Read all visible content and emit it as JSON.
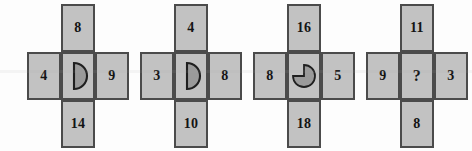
{
  "figure": {
    "background_color": "#fdfdfd",
    "cell_fill_color": "#c2c2c2",
    "cell_border_color": "#4b4b4b",
    "text_color": "#141414"
  },
  "crosses": [
    {
      "name": "cross-1",
      "top": "8",
      "left": "4",
      "right": "9",
      "bottom": "14",
      "center_text": "",
      "center_icon": "half-disc-icon"
    },
    {
      "name": "cross-2",
      "top": "4",
      "left": "3",
      "right": "8",
      "bottom": "10",
      "center_text": "",
      "center_icon": "half-disc-icon"
    },
    {
      "name": "cross-3",
      "top": "16",
      "left": "8",
      "right": "5",
      "bottom": "18",
      "center_text": "",
      "center_icon": "three-quarter-disc-icon"
    },
    {
      "name": "cross-4",
      "top": "11",
      "left": "9",
      "right": "3",
      "bottom": "8",
      "center_text": "?",
      "center_icon": "question-mark"
    }
  ]
}
